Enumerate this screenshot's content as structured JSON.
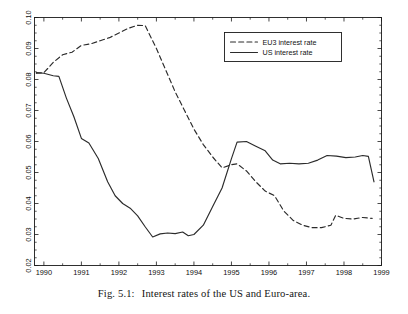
{
  "figure": {
    "caption_tag": "Fig. 5.1:",
    "caption_text": "Interest rates of the US and Euro-area."
  },
  "chart_data": {
    "type": "line",
    "title": "",
    "xlabel": "",
    "ylabel": "",
    "xlim": [
      1989.75,
      1999.0
    ],
    "ylim": [
      0.02,
      0.1
    ],
    "grid": false,
    "legend_position": "top-right",
    "x_ticks": [
      1990,
      1991,
      1992,
      1993,
      1994,
      1995,
      1996,
      1997,
      1998,
      1999
    ],
    "x_tick_labels": [
      "1990",
      "1991",
      "1992",
      "1993",
      "1994",
      "1995",
      "1996",
      "1997",
      "1998",
      "1999"
    ],
    "x_minor_tick_step": 0.5,
    "y_ticks": [
      0.02,
      0.03,
      0.04,
      0.05,
      0.06,
      0.07,
      0.08,
      0.09,
      0.1
    ],
    "y_tick_labels": [
      "0.02",
      "0.03",
      "0.04",
      "0.05",
      "0.06",
      "0.07",
      "0.08",
      "0.09",
      "0.10"
    ],
    "y_minor_tick_step": 0.0025,
    "series": [
      {
        "name": "EU3 interest rate",
        "style": "dashed",
        "color": "#2b2b2b",
        "x": [
          1989.8,
          1990.0,
          1990.25,
          1990.5,
          1990.75,
          1991.0,
          1991.25,
          1991.5,
          1991.75,
          1992.0,
          1992.25,
          1992.5,
          1992.7,
          1993.0,
          1993.25,
          1993.5,
          1993.75,
          1994.0,
          1994.25,
          1994.5,
          1994.75,
          1995.0,
          1995.15,
          1995.4,
          1995.65,
          1995.9,
          1996.15,
          1996.4,
          1996.65,
          1996.9,
          1997.15,
          1997.4,
          1997.65,
          1997.78,
          1998.0,
          1998.25,
          1998.5,
          1998.75
        ],
        "values": [
          0.082,
          0.0822,
          0.0855,
          0.088,
          0.0888,
          0.091,
          0.0915,
          0.0925,
          0.0935,
          0.095,
          0.0965,
          0.0975,
          0.0974,
          0.09,
          0.083,
          0.076,
          0.07,
          0.064,
          0.059,
          0.055,
          0.0515,
          0.0525,
          0.0528,
          0.0505,
          0.047,
          0.044,
          0.0425,
          0.0375,
          0.0345,
          0.033,
          0.0322,
          0.0322,
          0.033,
          0.0362,
          0.0352,
          0.035,
          0.0355,
          0.0352
        ]
      },
      {
        "name": "US interest rate",
        "style": "solid",
        "color": "#2b2b2b",
        "x": [
          1989.8,
          1990.0,
          1990.25,
          1990.4,
          1990.6,
          1990.8,
          1991.0,
          1991.2,
          1991.45,
          1991.7,
          1991.9,
          1992.1,
          1992.3,
          1992.5,
          1992.7,
          1992.9,
          1993.1,
          1993.3,
          1993.5,
          1993.7,
          1993.85,
          1994.0,
          1994.25,
          1994.5,
          1994.75,
          1995.0,
          1995.15,
          1995.4,
          1995.65,
          1995.9,
          1996.1,
          1996.3,
          1996.55,
          1996.8,
          1997.05,
          1997.3,
          1997.55,
          1997.8,
          1998.05,
          1998.3,
          1998.5,
          1998.65,
          1998.8
        ],
        "values": [
          0.0822,
          0.082,
          0.0812,
          0.081,
          0.074,
          0.068,
          0.061,
          0.0595,
          0.0545,
          0.047,
          0.0425,
          0.04,
          0.0385,
          0.036,
          0.0325,
          0.0292,
          0.0302,
          0.0305,
          0.0303,
          0.0308,
          0.0296,
          0.03,
          0.033,
          0.039,
          0.045,
          0.0545,
          0.0598,
          0.06,
          0.0585,
          0.057,
          0.054,
          0.0528,
          0.053,
          0.0528,
          0.053,
          0.054,
          0.0555,
          0.0553,
          0.0548,
          0.055,
          0.0555,
          0.0552,
          0.047
        ]
      }
    ],
    "annotations": []
  },
  "legend": {
    "items": [
      {
        "label": "EU3 interest rate",
        "style": "dashed"
      },
      {
        "label": "US interest rate",
        "style": "solid"
      }
    ]
  }
}
